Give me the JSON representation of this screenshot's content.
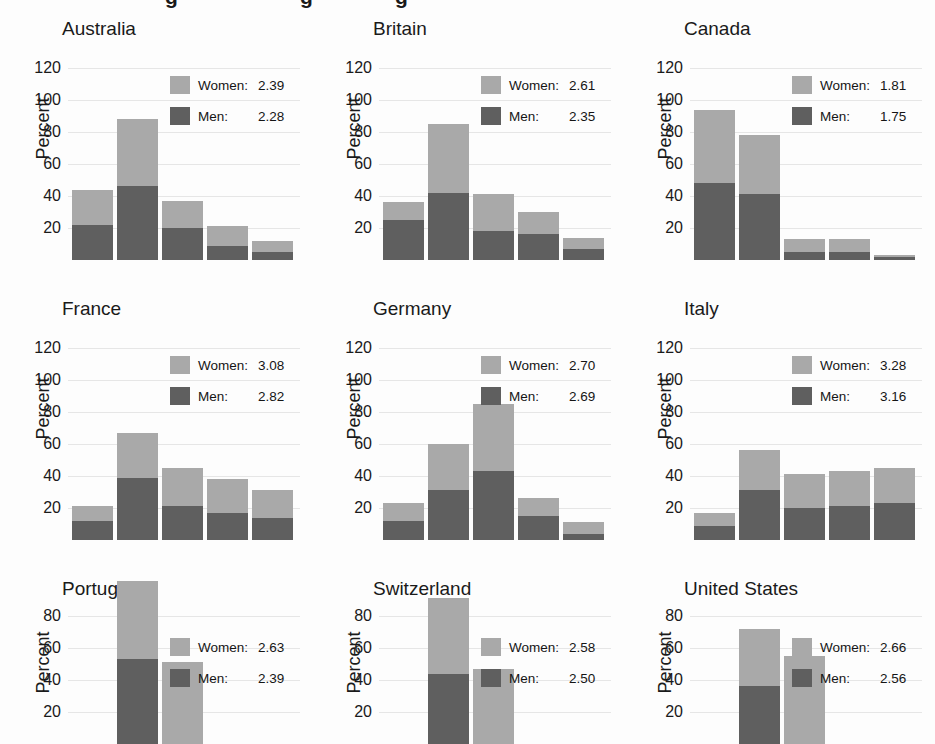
{
  "figure": {
    "supertitle_fragment": "cut-off title descenders",
    "axis": {
      "ylabel": "Percent",
      "yticks": [
        20,
        40,
        60,
        80,
        100,
        120
      ],
      "ymin": 0,
      "ymax": 130
    },
    "legend": {
      "women_label": "Women:",
      "men_label": "Men:"
    },
    "colors": {
      "women": "#a9a9a9",
      "men": "#5f5f5f",
      "gridline": "#e6e6e6",
      "text": "#1a1a1a",
      "background": "#fdfdfd"
    }
  },
  "chart_data": [
    {
      "type": "bar",
      "title": "Australia",
      "xlabel": "",
      "ylabel": "Percent",
      "ylim": [
        0,
        130
      ],
      "yticks": [
        20,
        40,
        60,
        80,
        100,
        120
      ],
      "grid": true,
      "legend_position": "top-right",
      "stacked": true,
      "categories": [
        "1",
        "2",
        "3",
        "4",
        "5"
      ],
      "series": [
        {
          "name": "Men",
          "values": [
            22,
            46,
            20,
            9,
            5
          ]
        },
        {
          "name": "Women",
          "values": [
            22,
            42,
            17,
            12,
            7
          ]
        }
      ],
      "totals": [
        44,
        88,
        37,
        21,
        12
      ],
      "legend": {
        "women": "2.39",
        "men": "2.28"
      }
    },
    {
      "type": "bar",
      "title": "Britain",
      "xlabel": "",
      "ylabel": "Percent",
      "ylim": [
        0,
        130
      ],
      "yticks": [
        20,
        40,
        60,
        80,
        100,
        120
      ],
      "grid": true,
      "legend_position": "top-right",
      "stacked": true,
      "categories": [
        "1",
        "2",
        "3",
        "4",
        "5"
      ],
      "series": [
        {
          "name": "Men",
          "values": [
            25,
            42,
            18,
            16,
            7
          ]
        },
        {
          "name": "Women",
          "values": [
            11,
            43,
            23,
            14,
            7
          ]
        }
      ],
      "totals": [
        36,
        85,
        41,
        30,
        14
      ],
      "legend": {
        "women": "2.61",
        "men": "2.35"
      }
    },
    {
      "type": "bar",
      "title": "Canada",
      "xlabel": "",
      "ylabel": "Percent",
      "ylim": [
        0,
        130
      ],
      "yticks": [
        20,
        40,
        60,
        80,
        100,
        120
      ],
      "grid": true,
      "legend_position": "top-right",
      "stacked": true,
      "categories": [
        "1",
        "2",
        "3",
        "4",
        "5"
      ],
      "series": [
        {
          "name": "Men",
          "values": [
            48,
            41,
            5,
            5,
            2
          ]
        },
        {
          "name": "Women",
          "values": [
            46,
            37,
            8,
            8,
            1
          ]
        }
      ],
      "totals": [
        94,
        78,
        13,
        13,
        3
      ],
      "legend": {
        "women": "1.81",
        "men": "1.75"
      }
    },
    {
      "type": "bar",
      "title": "France",
      "xlabel": "",
      "ylabel": "Percent",
      "ylim": [
        0,
        130
      ],
      "yticks": [
        20,
        40,
        60,
        80,
        100,
        120
      ],
      "grid": true,
      "legend_position": "top-right",
      "stacked": true,
      "categories": [
        "1",
        "2",
        "3",
        "4",
        "5"
      ],
      "series": [
        {
          "name": "Men",
          "values": [
            12,
            39,
            21,
            17,
            14
          ]
        },
        {
          "name": "Women",
          "values": [
            9,
            28,
            24,
            21,
            17
          ]
        }
      ],
      "totals": [
        21,
        67,
        45,
        38,
        31
      ],
      "legend": {
        "women": "3.08",
        "men": "2.82"
      }
    },
    {
      "type": "bar",
      "title": "Germany",
      "xlabel": "",
      "ylabel": "Percent",
      "ylim": [
        0,
        130
      ],
      "yticks": [
        20,
        40,
        60,
        80,
        100,
        120
      ],
      "grid": true,
      "legend_position": "top-right",
      "stacked": true,
      "categories": [
        "1",
        "2",
        "3",
        "4",
        "5"
      ],
      "series": [
        {
          "name": "Men",
          "values": [
            12,
            31,
            43,
            15,
            4
          ]
        },
        {
          "name": "Women",
          "values": [
            11,
            29,
            42,
            11,
            7
          ]
        }
      ],
      "totals": [
        23,
        60,
        85,
        26,
        11
      ],
      "legend": {
        "women": "2.70",
        "men": "2.69"
      }
    },
    {
      "type": "bar",
      "title": "Italy",
      "xlabel": "",
      "ylabel": "Percent",
      "ylim": [
        0,
        130
      ],
      "yticks": [
        20,
        40,
        60,
        80,
        100,
        120
      ],
      "grid": true,
      "legend_position": "top-right",
      "stacked": true,
      "categories": [
        "1",
        "2",
        "3",
        "4",
        "5"
      ],
      "series": [
        {
          "name": "Men",
          "values": [
            9,
            31,
            20,
            21,
            23
          ]
        },
        {
          "name": "Women",
          "values": [
            8,
            25,
            21,
            22,
            22
          ]
        }
      ],
      "totals": [
        17,
        56,
        41,
        43,
        45
      ],
      "legend": {
        "women": "3.28",
        "men": "3.16"
      }
    },
    {
      "type": "bar",
      "title": "Portugal",
      "xlabel": "",
      "ylabel": "Percent",
      "ylim": [
        0,
        130
      ],
      "yticks": [
        20,
        40,
        60,
        80,
        100,
        120
      ],
      "grid": true,
      "legend_position": "top-right",
      "stacked": true,
      "clipped_bottom": true,
      "categories": [
        "1",
        "2",
        "3",
        "4",
        "5"
      ],
      "series": [
        {
          "name": "Men",
          "values": [
            0,
            53,
            0,
            0,
            0
          ]
        },
        {
          "name": "Women",
          "values": [
            0,
            49,
            51,
            0,
            0
          ]
        }
      ],
      "totals": [
        0,
        102,
        51,
        0,
        0
      ],
      "legend": {
        "women": "2.63",
        "men": "2.39"
      }
    },
    {
      "type": "bar",
      "title": "Switzerland",
      "xlabel": "",
      "ylabel": "Percent",
      "ylim": [
        0,
        130
      ],
      "yticks": [
        20,
        40,
        60,
        80,
        100,
        120
      ],
      "grid": true,
      "legend_position": "top-right",
      "stacked": true,
      "clipped_bottom": true,
      "categories": [
        "1",
        "2",
        "3",
        "4",
        "5"
      ],
      "series": [
        {
          "name": "Men",
          "values": [
            0,
            44,
            0,
            0,
            0
          ]
        },
        {
          "name": "Women",
          "values": [
            0,
            47,
            47,
            0,
            0
          ]
        }
      ],
      "totals": [
        0,
        91,
        47,
        0,
        0
      ],
      "legend": {
        "women": "2.58",
        "men": "2.50"
      }
    },
    {
      "type": "bar",
      "title": "United States",
      "xlabel": "",
      "ylabel": "Percent",
      "ylim": [
        0,
        130
      ],
      "yticks": [
        20,
        40,
        60,
        80,
        100,
        120
      ],
      "grid": true,
      "legend_position": "top-right",
      "stacked": true,
      "clipped_bottom": true,
      "categories": [
        "1",
        "2",
        "3",
        "4",
        "5"
      ],
      "series": [
        {
          "name": "Men",
          "values": [
            0,
            36,
            0,
            0,
            0
          ]
        },
        {
          "name": "Women",
          "values": [
            0,
            36,
            55,
            0,
            0
          ]
        }
      ],
      "totals": [
        0,
        72,
        55,
        0,
        0
      ],
      "legend": {
        "women": "2.66",
        "men": "2.56"
      }
    }
  ]
}
